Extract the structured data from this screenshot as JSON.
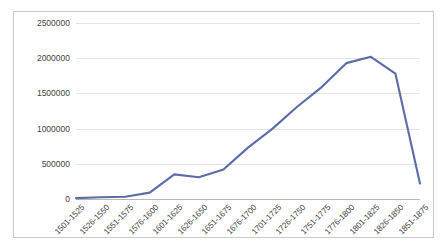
{
  "chart_data": {
    "type": "line",
    "title": "",
    "subtitle": "",
    "xlabel": "",
    "ylabel": "",
    "categories": [
      "1501-1525",
      "1526-1550",
      "1551-1575",
      "1576-1600",
      "1601-1625",
      "1626-1650",
      "1651-1675",
      "1676-1700",
      "1701-1725",
      "1726-1750",
      "1751-1775",
      "1776-1800",
      "1801-1825",
      "1826-1850",
      "1851-1875"
    ],
    "values": [
      13000,
      25000,
      31000,
      90000,
      350000,
      310000,
      420000,
      730000,
      1000000,
      1310000,
      1590000,
      1930000,
      2020000,
      1780000,
      220000
    ],
    "series": [
      {
        "name": "Series 1",
        "color": "#5b6ca8",
        "values": [
          13000,
          25000,
          31000,
          90000,
          350000,
          310000,
          420000,
          730000,
          1000000,
          1310000,
          1590000,
          1930000,
          2020000,
          1780000,
          220000
        ]
      }
    ],
    "ylim": [
      0,
      2500000
    ],
    "yticks": [
      0,
      500000,
      1000000,
      1500000,
      2000000,
      2500000
    ],
    "ytick_labels": [
      "0",
      "500000",
      "1000000",
      "1500000",
      "2000000",
      "2500000"
    ],
    "grid": "horizontal",
    "legend": "none",
    "markers": "none",
    "annotations": []
  },
  "style": {
    "line_color": "#5b6ca8",
    "gridline_color": "#e4e4e4",
    "axis_color": "#b8b8b8",
    "border_color": "#c9c9c9",
    "text_color": "#3f3f3f",
    "background": "#ffffff"
  }
}
